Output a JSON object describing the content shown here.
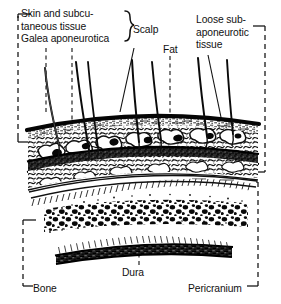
{
  "figure": {
    "type": "anatomical-cross-section-illustration",
    "background_color": "#ffffff",
    "ink_color": "#111111"
  },
  "labels": {
    "skin_line1": "Skin and subcu-",
    "skin_line2": "taneous tissue",
    "galea": "Galea aponeurotica",
    "scalp": "Scalp",
    "fat": "Fat",
    "loose_line1": "Loose sub-",
    "loose_line2": "aponeurotic",
    "loose_line3": "tissue",
    "dura": "Dura",
    "bone": "Bone",
    "pericranium": "Pericranium"
  },
  "layers": [
    {
      "name": "skin-surface",
      "label": "Skin and subcutaneous tissue"
    },
    {
      "name": "subcutaneous-fat",
      "label": "Fat"
    },
    {
      "name": "galea-aponeurotica",
      "label": "Galea aponeurotica"
    },
    {
      "name": "loose-subaponeurotic-tissue",
      "label": "Loose subaponeurotic tissue"
    },
    {
      "name": "pericranium",
      "label": "Pericranium"
    },
    {
      "name": "bone-diploe",
      "label": "Bone"
    },
    {
      "name": "dura-mater",
      "label": "Dura"
    }
  ],
  "brackets": [
    {
      "name": "scalp-brace",
      "label": "Scalp",
      "side": "right-of-text"
    },
    {
      "name": "scalp-left-bracket",
      "label": "Skin and subcutaneous tissue / Galea aponeurotica",
      "side": "left"
    },
    {
      "name": "loose-tissue-right-bracket",
      "label": "Loose subaponeurotic tissue",
      "side": "right"
    },
    {
      "name": "bone-left-bracket",
      "label": "Bone",
      "side": "left"
    },
    {
      "name": "pericranium-right-bracket",
      "label": "Pericranium",
      "side": "right"
    }
  ],
  "hairs": {
    "count": 7
  }
}
